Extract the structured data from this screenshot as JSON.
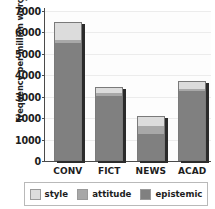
{
  "top_sliver_text": "g",
  "chart_data": {
    "type": "bar",
    "subtype": "stacked",
    "title": "",
    "xlabel": "",
    "ylabel": "frequency per million words",
    "ylim": [
      0,
      7000
    ],
    "ytick_step": 1000,
    "yticks": [
      "0",
      "1000",
      "2000",
      "3000",
      "4000",
      "5000",
      "6000",
      "7000"
    ],
    "grid": true,
    "legend_position": "bottom",
    "categories": [
      "CONV",
      "FICT",
      "NEWS",
      "ACAD"
    ],
    "series": [
      {
        "name": "epistemic",
        "color": "#808080",
        "values": [
          5500,
          3050,
          1250,
          3250
        ]
      },
      {
        "name": "attitude",
        "color": "#a8a8a8",
        "values": [
          150,
          130,
          400,
          120
        ]
      },
      {
        "name": "style",
        "color": "#dcdcdc",
        "values": [
          850,
          270,
          430,
          380
        ]
      }
    ],
    "totals": [
      6500,
      3450,
      2080,
      3750
    ]
  },
  "legend": {
    "items": [
      {
        "label": "style",
        "color": "#dcdcdc"
      },
      {
        "label": "attitude",
        "color": "#a8a8a8"
      },
      {
        "label": "epistemic",
        "color": "#808080"
      }
    ]
  }
}
